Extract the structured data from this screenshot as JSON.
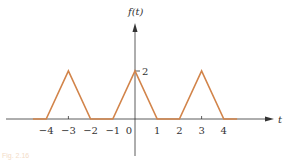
{
  "chart_data": {
    "type": "line",
    "title": "",
    "xlabel": "t",
    "ylabel": "f(t)",
    "x": [
      -4.6,
      -4,
      -3,
      -2,
      -1,
      0,
      1,
      2,
      3,
      4,
      4.6
    ],
    "series": [
      {
        "name": "f(t)",
        "values": [
          0,
          0,
          2,
          0,
          0,
          2,
          0,
          0,
          2,
          0,
          0
        ]
      }
    ],
    "x_ticks": [
      -4,
      -3,
      -2,
      -1,
      0,
      1,
      2,
      3,
      4
    ],
    "x_tick_labels": [
      "−4",
      "−3",
      "−2",
      "−1",
      "0",
      "1",
      "2",
      "3",
      "4"
    ],
    "y_ticks": [
      2
    ],
    "y_tick_labels": [
      "2"
    ],
    "xlim": [
      -5.5,
      6.2
    ],
    "ylim": [
      -0.9,
      3.3
    ],
    "grid": false,
    "legend": "none",
    "line_color": "#d2844a",
    "axis_color": "#333333",
    "annotations": [
      "periodic triangular pulses of height 2 and base width 2, period 3"
    ]
  },
  "labels": {
    "y_axis": "f(t)",
    "x_axis": "t",
    "y_tick": "2",
    "caption": "Fig. 2.16"
  }
}
